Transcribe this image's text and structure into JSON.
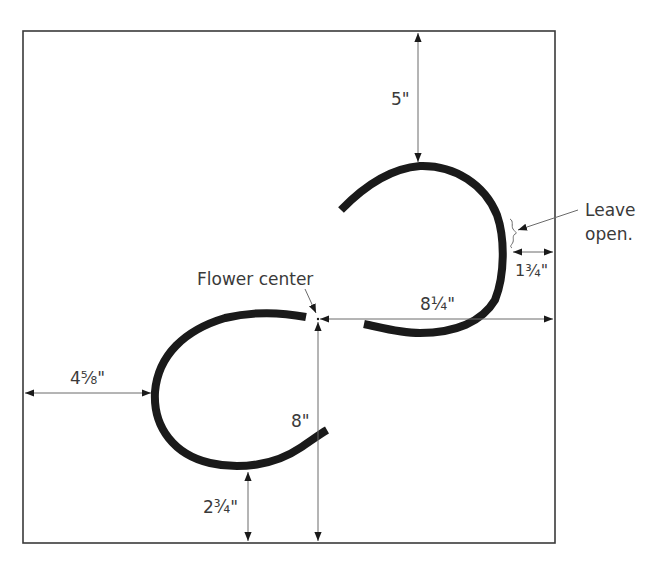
{
  "diagram": {
    "colors": {
      "cord": "#1a1a1a",
      "frame": "#3a3a3a",
      "dimension_line": "#6a6a6a",
      "text": "#3a3a3a"
    },
    "labels": {
      "top_offset": "5\"",
      "right_gap": "1¾\"",
      "center_to_right": "8¼\"",
      "left_offset": "4⅝\"",
      "center_to_bottom": "8\"",
      "bottom_offset": "2¾\"",
      "flower_center": "Flower center",
      "leave_open_line1": "Leave",
      "leave_open_line2": "open."
    }
  }
}
